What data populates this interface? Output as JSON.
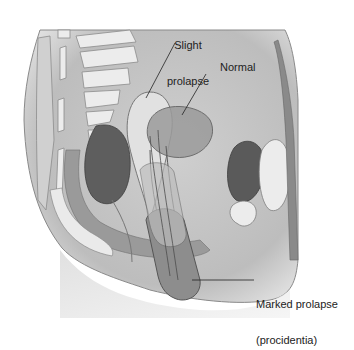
{
  "figure": {
    "labels": {
      "slight_line1": "Slight",
      "slight_line2": "prolapse",
      "normal": "Normal",
      "marked_line1": "Marked prolapse",
      "marked_line2": "(procidentia)"
    },
    "colors": {
      "background": "#ffffff",
      "tissue_light": "#d8d8d8",
      "tissue_mid": "#a9a9a9",
      "tissue_dark": "#6e6e6e",
      "bone": "#ececec",
      "outline": "#555555",
      "leader_line": "#222222"
    }
  }
}
